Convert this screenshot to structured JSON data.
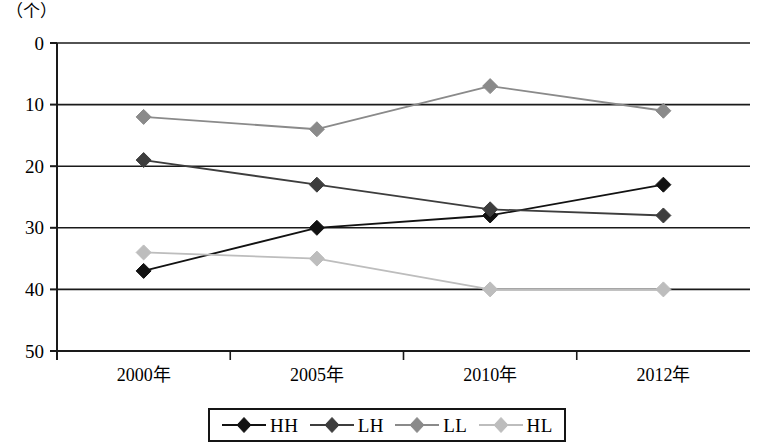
{
  "axis": {
    "unit_label": "（个）",
    "y_ticks": [
      "50",
      "40",
      "30",
      "20",
      "10",
      "0"
    ],
    "x_ticks": [
      "2000年",
      "2005年",
      "2010年",
      "2012年"
    ]
  },
  "legend": {
    "items": [
      {
        "label": "HH",
        "color": "#121212",
        "marker": "diamond-marker"
      },
      {
        "label": "LH",
        "color": "#3d3d3d",
        "marker": "diamond-marker"
      },
      {
        "label": "LL",
        "color": "#8a8a8a",
        "marker": "diamond-marker"
      },
      {
        "label": "HL",
        "color": "#bdbdbd",
        "marker": "diamond-marker"
      }
    ]
  },
  "chart_data": {
    "type": "line",
    "title": "",
    "subtitle": "",
    "xlabel": "",
    "ylabel": "（个）",
    "categories": [
      "2000年",
      "2005年",
      "2010年",
      "2012年"
    ],
    "ylim": [
      0,
      50
    ],
    "yticks": [
      0,
      10,
      20,
      30,
      40,
      50
    ],
    "grid": true,
    "legend_position": "bottom",
    "series": [
      {
        "name": "HH",
        "color": "#121212",
        "marker": "diamond",
        "values": [
          13,
          20,
          22,
          27
        ]
      },
      {
        "name": "LH",
        "color": "#3d3d3d",
        "marker": "diamond",
        "values": [
          31,
          27,
          23,
          22
        ]
      },
      {
        "name": "LL",
        "color": "#8a8a8a",
        "marker": "diamond",
        "values": [
          38,
          36,
          43,
          39
        ]
      },
      {
        "name": "HL",
        "color": "#bdbdbd",
        "marker": "diamond",
        "values": [
          16,
          15,
          10,
          10
        ]
      }
    ]
  }
}
